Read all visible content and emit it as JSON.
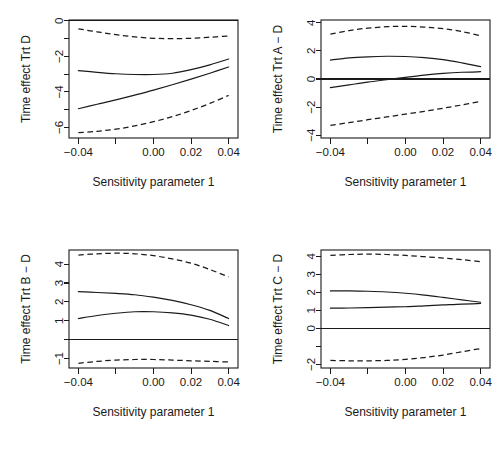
{
  "figure": {
    "layout": "2x2 grid of sensitivity analysis plots",
    "background_color": "#ffffff",
    "line_color": "#1a1a1a"
  },
  "shared": {
    "xlabel": "Sensitivity parameter 1",
    "x_tick_values": [
      -0.04,
      -0.02,
      0.0,
      0.02,
      0.04
    ],
    "x_tick_labels": [
      "−0.04",
      "",
      "0.00",
      "0.02",
      "0.04"
    ],
    "xlim": [
      -0.045,
      0.045
    ],
    "reference_line_value": 0,
    "legend": "",
    "grid": "off"
  },
  "chart_data": [
    {
      "type": "line",
      "panel": "top-left",
      "title": "",
      "ylabel": "Time effect Trt D",
      "xlabel": "Sensitivity parameter 1",
      "x": [
        -0.04,
        -0.03,
        -0.02,
        -0.01,
        0.0,
        0.01,
        0.02,
        0.03,
        0.04
      ],
      "xlim": [
        -0.045,
        0.045
      ],
      "ylim": [
        -6.6,
        0.05
      ],
      "y_tick_values": [
        0,
        -1,
        -2,
        -3,
        -4,
        -5,
        -6
      ],
      "y_tick_labels": [
        "0",
        "",
        "−2",
        "",
        "−4",
        "",
        "−6"
      ],
      "reference_line_value": 0,
      "series": [
        {
          "name": "upper confidence bound",
          "style": "dashed",
          "values": [
            -0.45,
            -0.62,
            -0.78,
            -0.9,
            -0.98,
            -1.0,
            -0.98,
            -0.92,
            -0.85
          ]
        },
        {
          "name": "estimate upper",
          "style": "solid",
          "values": [
            -2.8,
            -2.9,
            -2.98,
            -3.02,
            -3.02,
            -2.95,
            -2.75,
            -2.48,
            -2.15
          ]
        },
        {
          "name": "estimate lower",
          "style": "solid",
          "values": [
            -4.95,
            -4.7,
            -4.45,
            -4.18,
            -3.9,
            -3.6,
            -3.28,
            -2.95,
            -2.6
          ]
        },
        {
          "name": "lower confidence bound",
          "style": "dashed",
          "values": [
            -6.3,
            -6.22,
            -6.1,
            -5.92,
            -5.68,
            -5.4,
            -5.05,
            -4.65,
            -4.2
          ]
        }
      ]
    },
    {
      "type": "line",
      "panel": "top-right",
      "title": "",
      "ylabel": "Time effect Trt A − D",
      "xlabel": "Sensitivity parameter 1",
      "x": [
        -0.04,
        -0.03,
        -0.02,
        -0.01,
        0.0,
        0.01,
        0.02,
        0.03,
        0.04
      ],
      "xlim": [
        -0.045,
        0.045
      ],
      "ylim": [
        -4.2,
        4.2
      ],
      "y_tick_values": [
        4,
        2,
        0,
        -2,
        -4
      ],
      "y_tick_labels": [
        "4",
        "2",
        "0",
        "−2",
        "−4"
      ],
      "reference_line_value": 0,
      "series": [
        {
          "name": "upper confidence bound",
          "style": "dashed",
          "values": [
            3.2,
            3.45,
            3.62,
            3.72,
            3.75,
            3.7,
            3.58,
            3.38,
            3.08
          ]
        },
        {
          "name": "estimate upper",
          "style": "solid",
          "values": [
            1.35,
            1.5,
            1.58,
            1.62,
            1.6,
            1.52,
            1.38,
            1.15,
            0.88
          ]
        },
        {
          "name": "estimate lower",
          "style": "solid",
          "values": [
            -0.62,
            -0.42,
            -0.22,
            -0.05,
            0.12,
            0.28,
            0.4,
            0.48,
            0.52
          ]
        },
        {
          "name": "lower confidence bound",
          "style": "dashed",
          "values": [
            -3.3,
            -3.1,
            -2.9,
            -2.7,
            -2.5,
            -2.3,
            -2.08,
            -1.85,
            -1.6
          ]
        }
      ]
    },
    {
      "type": "line",
      "panel": "bottom-left",
      "title": "",
      "ylabel": "Time effect Trt B − D",
      "xlabel": "Sensitivity parameter 1",
      "x": [
        -0.04,
        -0.03,
        -0.02,
        -0.01,
        0.0,
        0.01,
        0.02,
        0.03,
        0.04
      ],
      "xlim": [
        -0.045,
        0.045
      ],
      "ylim": [
        -1.5,
        4.75
      ],
      "y_tick_values": [
        4,
        3,
        2,
        1,
        0,
        -1
      ],
      "y_tick_labels": [
        "4",
        "3",
        "2",
        "1",
        "",
        "−1"
      ],
      "reference_line_value": 0,
      "series": [
        {
          "name": "upper confidence bound",
          "style": "dashed",
          "values": [
            4.48,
            4.55,
            4.58,
            4.55,
            4.45,
            4.28,
            4.05,
            3.72,
            3.32
          ]
        },
        {
          "name": "estimate upper",
          "style": "solid",
          "values": [
            2.55,
            2.5,
            2.45,
            2.38,
            2.25,
            2.08,
            1.85,
            1.55,
            1.12
          ]
        },
        {
          "name": "estimate lower",
          "style": "solid",
          "values": [
            1.12,
            1.28,
            1.4,
            1.48,
            1.48,
            1.42,
            1.3,
            1.08,
            0.75
          ]
        },
        {
          "name": "lower confidence bound",
          "style": "dashed",
          "values": [
            -1.25,
            -1.15,
            -1.08,
            -1.05,
            -1.05,
            -1.08,
            -1.12,
            -1.15,
            -1.18
          ]
        }
      ]
    },
    {
      "type": "line",
      "panel": "bottom-right",
      "title": "",
      "ylabel": "Time effect Trt C − D",
      "xlabel": "Sensitivity parameter 1",
      "x": [
        -0.04,
        -0.03,
        -0.02,
        -0.01,
        0.0,
        0.01,
        0.02,
        0.03,
        0.04
      ],
      "xlim": [
        -0.045,
        0.045
      ],
      "ylim": [
        -2.2,
        4.35
      ],
      "y_tick_values": [
        4,
        3,
        2,
        1,
        0,
        -1,
        -2
      ],
      "y_tick_labels": [
        "4",
        "3",
        "2",
        "1",
        "0",
        "",
        "−2"
      ],
      "reference_line_value": 0,
      "series": [
        {
          "name": "upper confidence bound",
          "style": "dashed",
          "values": [
            4.05,
            4.1,
            4.12,
            4.1,
            4.05,
            3.98,
            3.9,
            3.82,
            3.7
          ]
        },
        {
          "name": "estimate upper",
          "style": "solid",
          "values": [
            2.08,
            2.08,
            2.06,
            2.02,
            1.95,
            1.85,
            1.72,
            1.58,
            1.45
          ]
        },
        {
          "name": "estimate lower",
          "style": "solid",
          "values": [
            1.12,
            1.13,
            1.15,
            1.18,
            1.2,
            1.25,
            1.3,
            1.35,
            1.38
          ]
        },
        {
          "name": "lower confidence bound",
          "style": "dashed",
          "values": [
            -1.78,
            -1.8,
            -1.8,
            -1.78,
            -1.72,
            -1.62,
            -1.48,
            -1.3,
            -1.12
          ]
        }
      ]
    }
  ]
}
